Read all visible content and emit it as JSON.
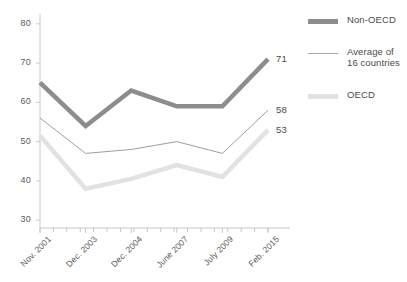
{
  "chart_data": {
    "type": "line",
    "title": "",
    "subtitle": "",
    "xlabel": "",
    "ylabel": "",
    "categories": [
      "Nov. 2001",
      "Dec. 2003",
      "Dec. 2004",
      "June 2007",
      "July 2009",
      "Feb. 2015"
    ],
    "x": [
      0,
      1,
      2,
      3,
      4,
      5
    ],
    "ylim": [
      28,
      82
    ],
    "yticks": [
      30,
      40,
      50,
      60,
      70,
      80
    ],
    "ytick_labels": [
      "30",
      "40",
      "50",
      "60",
      "70",
      "80"
    ],
    "grid": false,
    "legend_position": "right",
    "series": [
      {
        "name": "Non-OECD",
        "legend_label": "Non-OECD",
        "color": "#8d8d8d",
        "width": 4.5,
        "values": [
          65,
          54,
          63,
          59,
          59,
          71
        ],
        "end_label": "71"
      },
      {
        "name": "Average of 16 countries",
        "legend_label": "Average of\n16 countries",
        "color": "#9e9e9e",
        "width": 1,
        "values": [
          56,
          47,
          48,
          50,
          47,
          58
        ],
        "end_label": "58"
      },
      {
        "name": "OECD",
        "legend_label": "OECD",
        "color": "#e2e2e2",
        "width": 4.5,
        "values": [
          51.5,
          38,
          40.5,
          44,
          41,
          53
        ],
        "end_label": "53"
      }
    ],
    "axis_color": "#c8c8c8",
    "minor_xticks": 17
  }
}
